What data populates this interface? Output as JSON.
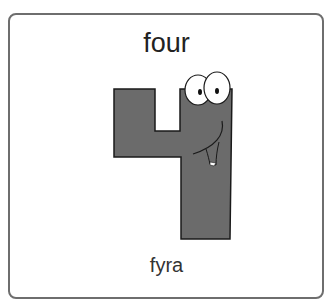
{
  "card": {
    "word": "four",
    "translation": "fyra",
    "illustration": "cartoon-number-four-icon",
    "colors": {
      "border": "#6e6e6e",
      "figure_fill": "#6b6b6b",
      "figure_outline": "#1a1a1a",
      "text": "#222222"
    }
  }
}
